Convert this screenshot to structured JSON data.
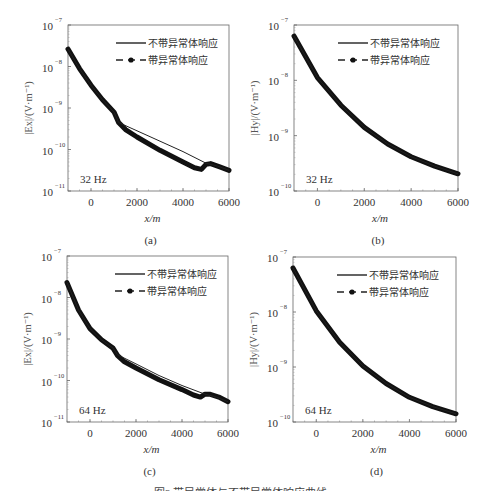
{
  "figure": {
    "caption": "图3  带异常体与不带异常体响应曲线"
  },
  "legend": {
    "solid": "不带异常体响应",
    "dashed": "带异常体响应"
  },
  "chart_data": [
    {
      "id": "a",
      "panel_label": "(a)",
      "type": "line",
      "yscale": "log",
      "title": "",
      "xlabel": "x/m",
      "ylabel": "|Ex|/(V·m⁻¹)",
      "xlim": [
        -1000,
        6000
      ],
      "ylim_log10": [
        -11,
        -7
      ],
      "xticks": [
        "0",
        "2000",
        "4000",
        "6000"
      ],
      "yticks": [
        "10^-11",
        "10^-10",
        "10^-9",
        "10^-8",
        "10^-7"
      ],
      "annotation": "32 Hz",
      "legend": [
        "不带异常体响应",
        "带异常体响应"
      ],
      "series": [
        {
          "name": "不带异常体响应",
          "style": "solid-thin",
          "x": [
            -1000,
            -500,
            0,
            500,
            1000,
            1200,
            2000,
            3000,
            4000,
            5000,
            5500,
            6000
          ],
          "log10y": [
            -7.58,
            -8.05,
            -8.45,
            -8.8,
            -9.1,
            -9.35,
            -9.55,
            -9.8,
            -10.05,
            -10.33,
            -10.4,
            -10.5
          ]
        },
        {
          "name": "带异常体响应",
          "style": "dashed-dot-thick",
          "x": [
            -1000,
            -500,
            0,
            500,
            1000,
            1200,
            1500,
            2000,
            3000,
            4000,
            4500,
            4800,
            5000,
            5200,
            5600,
            6000
          ],
          "log10y": [
            -7.58,
            -8.05,
            -8.45,
            -8.8,
            -9.1,
            -9.35,
            -9.52,
            -9.7,
            -10.02,
            -10.3,
            -10.44,
            -10.48,
            -10.36,
            -10.34,
            -10.42,
            -10.5
          ]
        }
      ]
    },
    {
      "id": "b",
      "panel_label": "(b)",
      "type": "line",
      "yscale": "log",
      "xlabel": "x/m",
      "ylabel": "|Hy|/(V·m⁻¹)",
      "xlim": [
        -1000,
        6000
      ],
      "ylim_log10": [
        -10,
        -7
      ],
      "xticks": [
        "0",
        "2000",
        "4000",
        "6000"
      ],
      "yticks": [
        "10^-10",
        "10^-9",
        "10^-8",
        "10^-7"
      ],
      "annotation": "32 Hz",
      "legend": [
        "不带异常体响应",
        "带异常体响应"
      ],
      "series": [
        {
          "name": "不带异常体响应",
          "style": "solid-thin",
          "x": [
            -1000,
            0,
            1000,
            2000,
            3000,
            4000,
            5000,
            6000
          ],
          "log10y": [
            -7.2,
            -7.95,
            -8.45,
            -8.85,
            -9.15,
            -9.38,
            -9.55,
            -9.69
          ]
        },
        {
          "name": "带异常体响应",
          "style": "dashed-dot-thick",
          "x": [
            -1000,
            0,
            1000,
            2000,
            3000,
            4000,
            5000,
            6000
          ],
          "log10y": [
            -7.2,
            -7.95,
            -8.45,
            -8.85,
            -9.15,
            -9.38,
            -9.55,
            -9.69
          ]
        }
      ]
    },
    {
      "id": "c",
      "panel_label": "(c)",
      "type": "line",
      "yscale": "log",
      "xlabel": "x/m",
      "ylabel": "|Ex|/(V·m⁻¹)",
      "xlim": [
        -1000,
        6000
      ],
      "ylim_log10": [
        -11,
        -7
      ],
      "xticks": [
        "0",
        "2000",
        "4000",
        "6000"
      ],
      "yticks": [
        "10^-11",
        "10^-10",
        "10^-9",
        "10^-8",
        "10^-7"
      ],
      "annotation": "64 Hz",
      "legend": [
        "不带异常体响应",
        "带异常体响应"
      ],
      "series": [
        {
          "name": "不带异常体响应",
          "style": "solid-thin",
          "x": [
            -1000,
            -500,
            0,
            500,
            1000,
            1200,
            2000,
            3000,
            4000,
            5000,
            5500,
            6000
          ],
          "log10y": [
            -7.64,
            -8.3,
            -8.75,
            -9.02,
            -9.22,
            -9.38,
            -9.6,
            -9.88,
            -10.12,
            -10.33,
            -10.4,
            -10.51
          ]
        },
        {
          "name": "带异常体响应",
          "style": "dashed-dot-thick",
          "x": [
            -1000,
            -500,
            0,
            500,
            1000,
            1200,
            1500,
            2000,
            3000,
            4000,
            4500,
            4800,
            5000,
            5200,
            5600,
            6000
          ],
          "log10y": [
            -7.64,
            -8.3,
            -8.75,
            -9.02,
            -9.22,
            -9.4,
            -9.55,
            -9.7,
            -9.98,
            -10.22,
            -10.35,
            -10.4,
            -10.33,
            -10.33,
            -10.4,
            -10.51
          ]
        }
      ]
    },
    {
      "id": "d",
      "panel_label": "(d)",
      "type": "line",
      "yscale": "log",
      "xlabel": "x/m",
      "ylabel": "|Hy|/(V·m⁻¹)",
      "xlim": [
        -1000,
        6000
      ],
      "ylim_log10": [
        -10,
        -7
      ],
      "xticks": [
        "0",
        "2000",
        "4000",
        "6000"
      ],
      "yticks": [
        "10^-10",
        "10^-9",
        "10^-8",
        "10^-7"
      ],
      "annotation": "64 Hz",
      "legend": [
        "不带异常体响应",
        "带异常体响应"
      ],
      "series": [
        {
          "name": "不带异常体响应",
          "style": "solid-thin",
          "x": [
            -1000,
            0,
            1000,
            2000,
            3000,
            4000,
            5000,
            6000
          ],
          "log10y": [
            -7.2,
            -7.98,
            -8.55,
            -8.98,
            -9.3,
            -9.55,
            -9.72,
            -9.85
          ]
        },
        {
          "name": "带异常体响应",
          "style": "dashed-dot-thick",
          "x": [
            -1000,
            0,
            1000,
            2000,
            3000,
            4000,
            5000,
            6000
          ],
          "log10y": [
            -7.2,
            -7.98,
            -8.55,
            -8.98,
            -9.3,
            -9.55,
            -9.72,
            -9.85
          ]
        }
      ]
    }
  ],
  "layout": {
    "panels": [
      {
        "left": 68,
        "top": 25,
        "right": 229,
        "bottom": 191
      },
      {
        "left": 294,
        "top": 25,
        "right": 458,
        "bottom": 191
      },
      {
        "left": 67,
        "top": 256,
        "right": 228,
        "bottom": 422
      },
      {
        "left": 293,
        "top": 257,
        "right": 456,
        "bottom": 422
      }
    ]
  }
}
